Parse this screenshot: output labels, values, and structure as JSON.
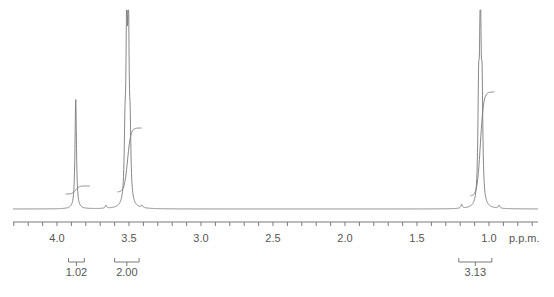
{
  "chart_data": {
    "type": "line",
    "title": "",
    "subtitle": "",
    "xlabel": "p.p.m.",
    "ylabel": "",
    "x_axis": {
      "reversed": true,
      "range": [
        4.3,
        0.7
      ],
      "major_ticks": [
        4.0,
        3.5,
        3.0,
        2.5,
        2.0,
        1.5,
        1.0
      ],
      "major_tick_labels": [
        "4.0",
        "3.5",
        "3.0",
        "2.5",
        "2.0",
        "1.5",
        "1.0"
      ],
      "minor_tick_step": 0.1,
      "unit_label": "p.p.m."
    },
    "grid": false,
    "legend": null,
    "line_color": "#7a7a7a",
    "peaks": [
      {
        "shift_ppm": 3.87,
        "multiplicity": "singlet",
        "relative_height": 0.55,
        "integral": 1.02,
        "integral_label": "1.02"
      },
      {
        "shift_ppm": 3.51,
        "multiplicity": "quartet",
        "relative_height": 0.86,
        "integral": 2.0,
        "integral_label": "2.00"
      },
      {
        "shift_ppm": 1.06,
        "multiplicity": "triplet",
        "relative_height": 1.0,
        "integral": 3.13,
        "integral_label": "3.13"
      }
    ],
    "integrals": [
      {
        "label": "1.02",
        "value": 1.02,
        "bracket_ppm": [
          3.92,
          3.81
        ]
      },
      {
        "label": "2.00",
        "value": 2.0,
        "bracket_ppm": [
          3.6,
          3.43
        ]
      },
      {
        "label": "3.13",
        "value": 3.13,
        "bracket_ppm": [
          1.21,
          0.98
        ]
      }
    ]
  }
}
